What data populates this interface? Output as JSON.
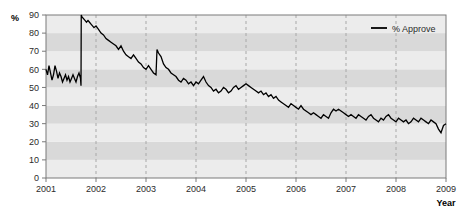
{
  "chart_data": {
    "type": "line",
    "title": "",
    "xlabel": "Year",
    "ylabel": "%",
    "xlim": [
      2001.0,
      2009.0
    ],
    "ylim": [
      0,
      90
    ],
    "grid": "vertical dashed gridlines at each year; horizontal alternating gray bands every 10 units",
    "legend": {
      "position": "top-right",
      "entries": [
        "% Approve"
      ]
    },
    "yticks": [
      0,
      10,
      20,
      30,
      40,
      50,
      60,
      70,
      80,
      90
    ],
    "yticklabels": [
      "0",
      "10",
      "20",
      "30",
      "40",
      "50",
      "60",
      "70",
      "80",
      "90"
    ],
    "xticks": [
      2001,
      2002,
      2003,
      2004,
      2005,
      2006,
      2007,
      2008,
      2009
    ],
    "xticklabels": [
      "2001",
      "2002",
      "2003",
      "2004",
      "2005",
      "2006",
      "2007",
      "2008",
      "2009"
    ],
    "series": [
      {
        "name": "% Approve",
        "color": "#000000",
        "x": [
          2001.0,
          2001.03,
          2001.06,
          2001.09,
          2001.12,
          2001.15,
          2001.18,
          2001.21,
          2001.24,
          2001.27,
          2001.3,
          2001.33,
          2001.36,
          2001.39,
          2001.42,
          2001.45,
          2001.48,
          2001.51,
          2001.54,
          2001.57,
          2001.6,
          2001.63,
          2001.66,
          2001.69,
          2001.7,
          2001.705,
          2001.72,
          2001.75,
          2001.78,
          2001.81,
          2001.84,
          2001.87,
          2001.9,
          2001.93,
          2001.96,
          2002.0,
          2002.05,
          2002.1,
          2002.15,
          2002.2,
          2002.25,
          2002.3,
          2002.35,
          2002.4,
          2002.45,
          2002.5,
          2002.55,
          2002.6,
          2002.65,
          2002.7,
          2002.75,
          2002.8,
          2002.85,
          2002.9,
          2002.95,
          2003.0,
          2003.05,
          2003.1,
          2003.15,
          2003.2,
          2003.22,
          2003.25,
          2003.3,
          2003.35,
          2003.4,
          2003.45,
          2003.5,
          2003.55,
          2003.6,
          2003.65,
          2003.7,
          2003.75,
          2003.8,
          2003.85,
          2003.9,
          2003.95,
          2004.0,
          2004.05,
          2004.1,
          2004.15,
          2004.2,
          2004.25,
          2004.3,
          2004.35,
          2004.4,
          2004.45,
          2004.5,
          2004.55,
          2004.6,
          2004.65,
          2004.7,
          2004.75,
          2004.8,
          2004.85,
          2004.9,
          2004.95,
          2005.0,
          2005.05,
          2005.1,
          2005.15,
          2005.2,
          2005.25,
          2005.3,
          2005.35,
          2005.4,
          2005.45,
          2005.5,
          2005.55,
          2005.6,
          2005.65,
          2005.7,
          2005.75,
          2005.8,
          2005.85,
          2005.9,
          2005.95,
          2006.0,
          2006.05,
          2006.1,
          2006.15,
          2006.2,
          2006.25,
          2006.3,
          2006.35,
          2006.4,
          2006.45,
          2006.5,
          2006.55,
          2006.6,
          2006.65,
          2006.7,
          2006.75,
          2006.8,
          2006.85,
          2006.9,
          2006.95,
          2007.0,
          2007.05,
          2007.1,
          2007.15,
          2007.2,
          2007.25,
          2007.3,
          2007.35,
          2007.4,
          2007.45,
          2007.5,
          2007.55,
          2007.6,
          2007.65,
          2007.7,
          2007.75,
          2007.8,
          2007.85,
          2007.9,
          2007.95,
          2008.0,
          2008.05,
          2008.1,
          2008.15,
          2008.2,
          2008.25,
          2008.3,
          2008.35,
          2008.4,
          2008.45,
          2008.5,
          2008.55,
          2008.6,
          2008.65,
          2008.7,
          2008.75,
          2008.8,
          2008.85,
          2008.9,
          2008.95,
          2009.0
        ],
        "y": [
          60,
          57,
          62,
          58,
          54,
          57,
          62,
          59,
          55,
          58,
          56,
          53,
          55,
          57,
          54,
          56,
          53,
          55,
          57,
          55,
          53,
          56,
          58,
          55,
          51,
          90,
          89,
          88,
          87,
          86,
          87,
          86,
          85,
          84,
          83,
          84,
          82,
          80,
          79,
          77,
          76,
          75,
          74,
          73,
          71,
          73,
          70,
          68,
          67,
          66,
          68,
          66,
          64,
          63,
          61,
          60,
          62,
          60,
          58,
          57,
          71,
          69,
          67,
          63,
          61,
          60,
          58,
          57,
          56,
          54,
          53,
          55,
          54,
          52,
          53,
          51,
          53,
          52,
          54,
          56,
          53,
          51,
          50,
          48,
          49,
          47,
          48,
          50,
          49,
          47,
          48,
          50,
          51,
          49,
          50,
          51,
          52,
          51,
          50,
          49,
          48,
          47,
          48,
          46,
          47,
          45,
          46,
          44,
          45,
          43,
          42,
          41,
          40,
          39,
          41,
          40,
          39,
          38,
          40,
          38,
          37,
          36,
          35,
          36,
          35,
          34,
          33,
          35,
          34,
          33,
          36,
          38,
          37,
          38,
          37,
          36,
          35,
          34,
          35,
          34,
          33,
          35,
          34,
          33,
          32,
          34,
          35,
          33,
          32,
          31,
          33,
          32,
          34,
          35,
          33,
          32,
          31,
          33,
          32,
          31,
          32,
          30,
          31,
          33,
          32,
          31,
          33,
          32,
          31,
          30,
          32,
          31,
          30,
          27,
          25,
          29,
          30
        ]
      }
    ]
  },
  "legend": {
    "label": "% Approve"
  },
  "axes": {
    "y_title": "%",
    "x_title": "Year"
  },
  "colors": {
    "line": "#000000",
    "band_light": "#ececec",
    "band_dark": "#d9d9d9",
    "axis": "#7a7a7a",
    "gridline": "#a8a8a8",
    "text": "#2b2b2b"
  }
}
